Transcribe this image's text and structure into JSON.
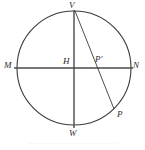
{
  "figure": {
    "type": "geometry-diagram",
    "background_color": "#ffffff",
    "stroke_color": "#3a3a3a",
    "label_color": "#2b2b2b",
    "circle": {
      "center_x": 74,
      "center_y": 68,
      "radius": 57
    },
    "labels": {
      "top": "V",
      "left": "M",
      "right": "N",
      "center": "H",
      "interior": "P'",
      "arc_point": "P",
      "bottom": "W"
    },
    "segments": [
      {
        "name": "horizontal-diameter",
        "from": "M",
        "to": "N"
      },
      {
        "name": "vertical-diameter",
        "from": "V",
        "to": "W"
      },
      {
        "name": "chord-v-p",
        "from": "V",
        "to": "P"
      }
    ]
  },
  "caption": {
    "text": "·············································",
    "legible": false
  }
}
